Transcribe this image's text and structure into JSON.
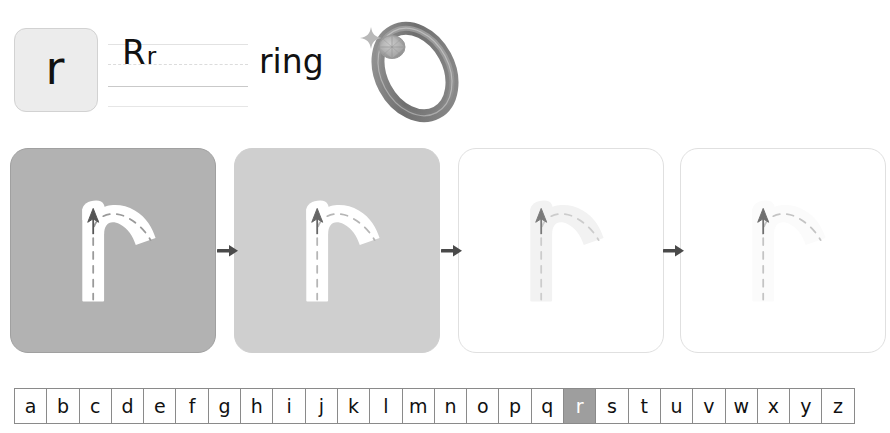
{
  "header": {
    "letter_tile": {
      "letter": "r",
      "bg_color": "#ececec",
      "border_color": "#d2d2d2"
    },
    "guide": {
      "uppercase": "R",
      "lowercase": "r",
      "line_color_solid": "#c9c9c9",
      "line_color_faint": "#e2e2e2",
      "line_color_dashed": "#dcdcdc"
    },
    "word": "ring",
    "illustration": {
      "name": "ring-illustration",
      "alt": "ring",
      "band_color": "#7f7f7f",
      "band_light": "#b4b4b4",
      "gem_color": "#a9a9a9",
      "sparkle_color": "#b8b8b8"
    }
  },
  "practice": {
    "letter": "r",
    "arrow_color": "#4a4a4a",
    "cards": [
      {
        "step": 1,
        "name": "practice-card-1",
        "bg_color": "#b2b2b2",
        "border_color": "#a0a0a0",
        "stroke_color": "#ffffff",
        "dash_color": "#9a9a9a",
        "arrow_color": "#555555",
        "opacity": 1
      },
      {
        "step": 2,
        "name": "practice-card-2",
        "bg_color": "#cfcfcf",
        "border_color": "#cfcfcf",
        "stroke_color": "#ffffff",
        "dash_color": "#b6b6b6",
        "arrow_color": "#666666",
        "opacity": 1
      },
      {
        "step": 3,
        "name": "practice-card-3",
        "bg_color": "#ffffff",
        "border_color": "#e0e0e0",
        "stroke_color": "#f2f2f2",
        "dash_color": "#cccccc",
        "arrow_color": "#7a7a7a",
        "opacity": 1
      },
      {
        "step": 4,
        "name": "practice-card-4",
        "bg_color": "#ffffff",
        "border_color": "#e0e0e0",
        "stroke_color": "#fbfbfb",
        "dash_color": "#c4c4c4",
        "arrow_color": "#6f6f6f",
        "opacity": 1
      }
    ],
    "arrows": [
      "arrow-1",
      "arrow-2",
      "arrow-3"
    ]
  },
  "alphabet": {
    "letters": [
      "a",
      "b",
      "c",
      "d",
      "e",
      "f",
      "g",
      "h",
      "i",
      "j",
      "k",
      "l",
      "m",
      "n",
      "o",
      "p",
      "q",
      "r",
      "s",
      "t",
      "u",
      "v",
      "w",
      "x",
      "y",
      "z"
    ],
    "active_letter": "r",
    "active_bg": "#9e9e9e",
    "active_fg": "#ffffff",
    "cell_border": "#8a8a8a"
  }
}
